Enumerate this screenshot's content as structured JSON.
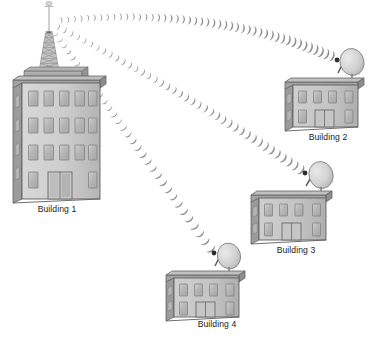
{
  "diagram": {
    "background_color": "#ffffff",
    "buildings": [
      {
        "id": "building-1",
        "label": "Building 1",
        "kind": "tower-building",
        "floors": 4,
        "windows_per_row": 5,
        "has_antenna_tower": true,
        "has_dish": false,
        "label_x": 57,
        "label_y": 212
      },
      {
        "id": "building-2",
        "label": "Building 2",
        "kind": "dish-building",
        "floors": 2,
        "windows_per_row": 4,
        "has_antenna_tower": false,
        "has_dish": true,
        "label_x": 328,
        "label_y": 140
      },
      {
        "id": "building-3",
        "label": "Building 3",
        "kind": "dish-building",
        "floors": 2,
        "windows_per_row": 4,
        "has_antenna_tower": false,
        "has_dish": true,
        "label_x": 296,
        "label_y": 253
      },
      {
        "id": "building-4",
        "label": "Building 4",
        "kind": "dish-building",
        "floors": 2,
        "windows_per_row": 4,
        "has_antenna_tower": false,
        "has_dish": true,
        "label_x": 217,
        "label_y": 327
      }
    ],
    "links": [
      {
        "id": "link-1-to-2",
        "from": "building-1",
        "to": "building-2",
        "arc_count": 46
      },
      {
        "id": "link-1-to-3",
        "from": "building-1",
        "to": "building-3",
        "arc_count": 40
      },
      {
        "id": "link-1-to-4",
        "from": "building-1",
        "to": "building-4",
        "arc_count": 33
      }
    ],
    "colors": {
      "facade": "#c9c9c9",
      "facade_light": "#d6d6d6",
      "facade_shadow": "#a8a8a8",
      "side_wall": "#9a9a9a",
      "roof_slab": "#8f8f8f",
      "roof_slab_top": "#b5b5b5",
      "window_fill": "#bdbdbd",
      "window_frame": "#7d7d7d",
      "door_fill": "#c2c2c2",
      "outline": "#5a5a5a",
      "tower": "#b0b0b0",
      "tower_dark": "#8a8a8a",
      "dish": "#d8d8d8",
      "dish_edge": "#7a7a7a",
      "wave": "#8c8c8c",
      "label_text": "#1b1b1b"
    }
  }
}
